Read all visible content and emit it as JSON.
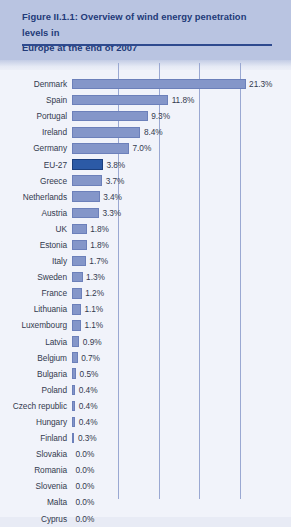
{
  "figure": {
    "title_line1": "Figure II.1.1: Overview of wind energy penetration levels in",
    "title_line2": "Europe at the end of 2007",
    "accent_color": "#2e4a8e",
    "band_color": "#b9c4e1",
    "bar_color": "#8496c9",
    "highlight_color": "#2c5aa6",
    "gridline_color": "#9aa8d2"
  },
  "chart_data": {
    "type": "bar",
    "orientation": "horizontal",
    "title": "Figure II.1.1: Overview of wind energy penetration levels in Europe at the end of 2007",
    "xlabel": "",
    "ylabel": "",
    "xlim": [
      0,
      25
    ],
    "grid": true,
    "gridline_values": [
      5,
      10,
      15,
      20
    ],
    "legend": "none",
    "value_suffix": "%",
    "highlight_category": "EU-27",
    "categories": [
      "Denmark",
      "Spain",
      "Portugal",
      "Ireland",
      "Germany",
      "EU-27",
      "Greece",
      "Netherlands",
      "Austria",
      "UK",
      "Estonia",
      "Italy",
      "Sweden",
      "France",
      "Lithuania",
      "Luxembourg",
      "Latvia",
      "Belgium",
      "Bulgaria",
      "Poland",
      "Czech republic",
      "Hungary",
      "Finland",
      "Slovakia",
      "Romania",
      "Slovenia",
      "Malta",
      "Cyprus"
    ],
    "values": [
      21.3,
      11.8,
      9.3,
      8.4,
      7.0,
      3.8,
      3.7,
      3.4,
      3.3,
      1.8,
      1.8,
      1.7,
      1.3,
      1.2,
      1.1,
      1.1,
      0.9,
      0.7,
      0.5,
      0.4,
      0.4,
      0.4,
      0.3,
      0.0,
      0.0,
      0.0,
      0.0,
      0.0
    ],
    "labels": [
      "21.3%",
      "11.8%",
      "9.3%",
      "8.4%",
      "7.0%",
      "3.8%",
      "3.7%",
      "3.4%",
      "3.3%",
      "1.8%",
      "1.8%",
      "1.7%",
      "1.3%",
      "1.2%",
      "1.1%",
      "1.1%",
      "0.9%",
      "0.7%",
      "0.5%",
      "0.4%",
      "0.4%",
      "0.4%",
      "0.3%",
      "0.0%",
      "0.0%",
      "0.0%",
      "0.0%",
      "0.0%"
    ]
  }
}
